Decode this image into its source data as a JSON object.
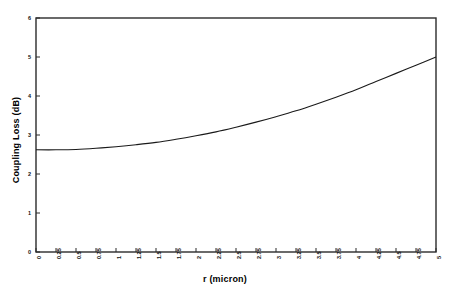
{
  "chart_data": {
    "type": "line",
    "title": "",
    "xlabel": "r (micron)",
    "ylabel": "Coupling Loss (dB)",
    "xlim": [
      0,
      5
    ],
    "ylim": [
      0,
      6
    ],
    "grid": false,
    "legend": "none",
    "xticks": [
      "0",
      "0.25",
      "0.5",
      "0.75",
      "1",
      "1.25",
      "1.5",
      "1.75",
      "2",
      "2.25",
      "2.5",
      "2.75",
      "3",
      "3.25",
      "3.5",
      "3.75",
      "4",
      "4.25",
      "4.5",
      "4.75",
      "5"
    ],
    "yticks": [
      "0",
      "1",
      "2",
      "3",
      "4",
      "5",
      "6"
    ],
    "series": [
      {
        "name": "Coupling Loss",
        "color": "#1a1a1a",
        "x": [
          0,
          0.25,
          0.5,
          0.75,
          1,
          1.25,
          1.5,
          1.75,
          2,
          2.25,
          2.5,
          2.75,
          3,
          3.25,
          3.5,
          3.75,
          4,
          4.25,
          4.5,
          4.75,
          5
        ],
        "values": [
          2.62,
          2.62,
          2.63,
          2.66,
          2.7,
          2.75,
          2.81,
          2.89,
          2.98,
          3.08,
          3.2,
          3.33,
          3.47,
          3.62,
          3.79,
          3.97,
          4.16,
          4.37,
          4.58,
          4.79,
          5.0
        ]
      }
    ]
  },
  "figure": {
    "background_color": "#ffffff",
    "axis_color": "#2b2b2b",
    "curve_color": "#1a1a1a"
  }
}
